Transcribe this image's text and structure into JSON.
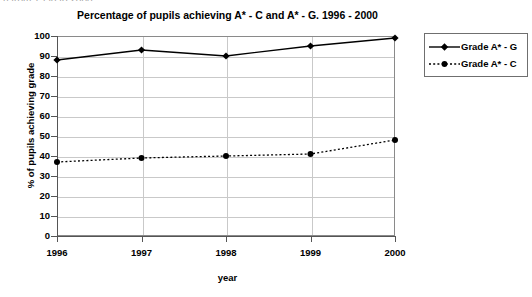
{
  "page": {
    "clipped_header_text": "n from 1996 to 2000."
  },
  "legend": {
    "position": "right",
    "items": [
      {
        "label": "Grade A* - G",
        "style": "solid",
        "marker": "diamond",
        "color": "#000000"
      },
      {
        "label": "Grade A* - C",
        "style": "dashed",
        "marker": "circle",
        "color": "#000000"
      }
    ]
  },
  "chart_data": {
    "type": "line",
    "title": "Percentage of pupils achieving A* - C and A* - G.  1996 - 2000",
    "xlabel": "year",
    "ylabel": "% of pupils achieving grade",
    "categories": [
      "1996",
      "1997",
      "1998",
      "1999",
      "2000"
    ],
    "x": [
      1996,
      1997,
      1998,
      1999,
      2000
    ],
    "ylim": [
      0,
      100
    ],
    "yticks": [
      0,
      10,
      20,
      30,
      40,
      50,
      60,
      70,
      80,
      90,
      100
    ],
    "grid": true,
    "series": [
      {
        "name": "Grade A* - G",
        "values": [
          88,
          93,
          90,
          95,
          99
        ],
        "style": "solid",
        "marker": "diamond",
        "color": "#000000"
      },
      {
        "name": "Grade A* - C",
        "values": [
          37,
          39,
          40,
          41,
          48
        ],
        "style": "dashed",
        "marker": "circle",
        "color": "#000000"
      }
    ]
  }
}
